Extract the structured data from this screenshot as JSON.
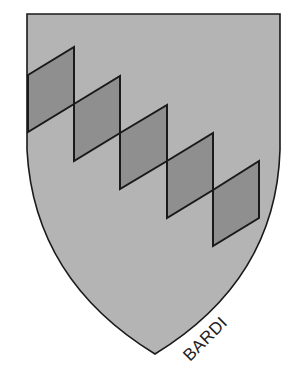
{
  "figure": {
    "caption": "BARDI",
    "colors": {
      "background": "#ffffff",
      "field": "#b4b4b4",
      "lozenge": "#8f8f8f",
      "outline": "#1a1a1a"
    },
    "lozenge_count": 5
  }
}
